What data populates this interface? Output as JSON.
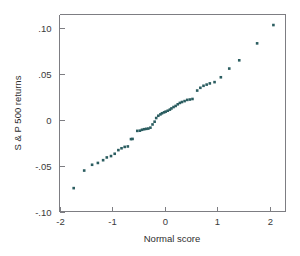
{
  "figure": {
    "background_color": "#ffffff",
    "frame_color": "#7d7d82",
    "point_color": "#2b5d60"
  },
  "chart_data": {
    "type": "scatter",
    "title": "",
    "subtitle": "",
    "xlabel": "Normal score",
    "ylabel": "S & P 500 returns",
    "xlim": [
      -2.0,
      2.3
    ],
    "ylim": [
      -0.1,
      0.115
    ],
    "xticks": [
      -2,
      -1,
      0,
      1,
      2
    ],
    "xticklabels": [
      "-2",
      "-1",
      "0",
      "1",
      "2"
    ],
    "yticks": [
      0.1,
      0.05,
      0,
      -0.05,
      -0.1
    ],
    "yticklabels": [
      ".10",
      ".05",
      "0",
      "-.05",
      "-.10"
    ],
    "grid": false,
    "legend": null,
    "annotations": [],
    "marker": "filled-square",
    "n_points": 52,
    "x": [
      -1.73,
      -1.53,
      -1.38,
      -1.27,
      -1.17,
      -1.1,
      -1.02,
      -0.95,
      -0.88,
      -0.82,
      -0.76,
      -0.7,
      -0.64,
      -0.61,
      -0.52,
      -0.47,
      -0.43,
      -0.39,
      -0.35,
      -0.31,
      -0.27,
      -0.23,
      -0.19,
      -0.16,
      -0.12,
      -0.08,
      -0.05,
      -0.01,
      0.02,
      0.06,
      0.1,
      0.13,
      0.17,
      0.21,
      0.25,
      0.29,
      0.33,
      0.38,
      0.43,
      0.48,
      0.53,
      0.62,
      0.68,
      0.74,
      0.8,
      0.86,
      0.95,
      1.07,
      1.23,
      1.42,
      1.76,
      2.07
    ],
    "y": [
      -0.0745,
      -0.0553,
      -0.049,
      -0.047,
      -0.044,
      -0.041,
      -0.0395,
      -0.037,
      -0.033,
      -0.031,
      -0.0295,
      -0.029,
      -0.021,
      -0.0208,
      -0.012,
      -0.0118,
      -0.0108,
      -0.0102,
      -0.0098,
      -0.0095,
      -0.0085,
      -0.005,
      -0.002,
      0.002,
      0.0045,
      0.006,
      0.0072,
      0.0082,
      0.009,
      0.01,
      0.0112,
      0.0125,
      0.014,
      0.0152,
      0.017,
      0.0185,
      0.0195,
      0.0205,
      0.0218,
      0.0222,
      0.0228,
      0.032,
      0.035,
      0.0372,
      0.0385,
      0.0398,
      0.0412,
      0.0465,
      0.056,
      0.065,
      0.0835,
      0.1035
    ]
  }
}
